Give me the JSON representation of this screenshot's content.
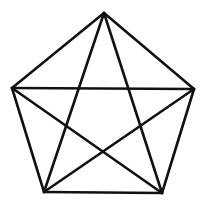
{
  "diagram": {
    "stroke_color": "#111111",
    "stroke_width": 2.6,
    "vertices": [
      {
        "id": "top",
        "x": 104,
        "y": 13
      },
      {
        "id": "right",
        "x": 194,
        "y": 89
      },
      {
        "id": "bottom-right",
        "x": 162,
        "y": 193
      },
      {
        "id": "bottom-left",
        "x": 44,
        "y": 192
      },
      {
        "id": "left",
        "x": 12,
        "y": 88
      }
    ],
    "edges": [
      [
        "top",
        "right"
      ],
      [
        "right",
        "bottom-right"
      ],
      [
        "bottom-right",
        "bottom-left"
      ],
      [
        "bottom-left",
        "left"
      ],
      [
        "left",
        "top"
      ],
      [
        "top",
        "bottom-right"
      ],
      [
        "top",
        "bottom-left"
      ],
      [
        "left",
        "right"
      ],
      [
        "left",
        "bottom-right"
      ],
      [
        "right",
        "bottom-left"
      ]
    ]
  }
}
